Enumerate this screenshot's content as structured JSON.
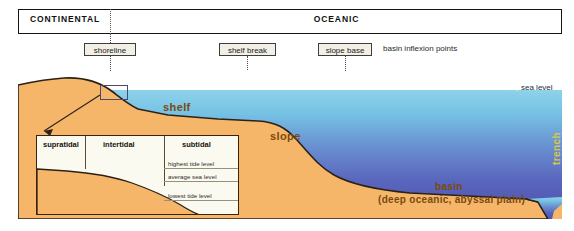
{
  "realm_bar": {
    "continental_label": "CONTINENTAL",
    "oceanic_label": "OCEANIC"
  },
  "inflexion": {
    "points": [
      {
        "id": "shoreline",
        "label": "shoreline"
      },
      {
        "id": "shelf-break",
        "label": "shelf break"
      },
      {
        "id": "slope-base",
        "label": "slope base"
      }
    ],
    "caption": "basin inflexion points"
  },
  "profile": {
    "shelf_label": "shelf",
    "slope_label": "slope",
    "basin_label": "basin",
    "basin_sublabel": "(deep oceanic, abyssal plain)",
    "trench_label": "trench",
    "sea_level_label": "sea level"
  },
  "inset": {
    "zones": [
      {
        "id": "supratidal",
        "label": "supratidal"
      },
      {
        "id": "intertidal",
        "label": "intertidal"
      },
      {
        "id": "subtidal",
        "label": "subtidal"
      }
    ],
    "tide_levels": [
      {
        "id": "highest-tide",
        "label": "highest tide level"
      },
      {
        "id": "average-sea",
        "label": "average sea level"
      },
      {
        "id": "lowest-tide",
        "label": "lowest tide level"
      }
    ]
  },
  "colors": {
    "sand": "#f5b66a",
    "sand_edge": "#2b2118",
    "ocean_top": "#7fc9e8",
    "ocean_bottom": "#5159b4",
    "label_brown": "#7a4a10",
    "trench_text": "#d9c64a",
    "inset_bg": "#fbfaf0"
  }
}
